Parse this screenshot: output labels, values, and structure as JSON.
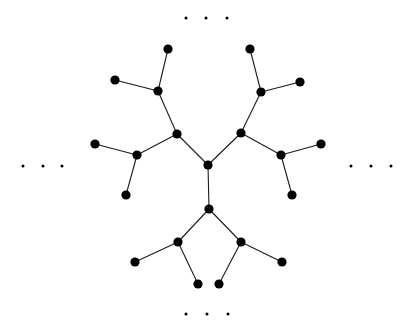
{
  "figure": {
    "width": 408,
    "height": 329,
    "background_color": "#ffffff",
    "node_color": "#000000",
    "edge_color": "#1a1a1a",
    "node_radius": 4.6,
    "ellipsis_dot_radius": 1.5,
    "edge_width": 1.1
  },
  "graph": {
    "type": "tree",
    "description": "Bethe lattice / Cayley tree with degree-3 root and continuing branches indicated by ellipses",
    "nodes": [
      {
        "id": "root",
        "label": "root",
        "x": 208,
        "y": 165
      },
      {
        "id": "u-left",
        "label": "u-left",
        "x": 177,
        "y": 134
      },
      {
        "id": "u-right",
        "label": "u-right",
        "x": 241,
        "y": 133
      },
      {
        "id": "d-center",
        "label": "d-center",
        "x": 209,
        "y": 209
      },
      {
        "id": "ul-up",
        "label": "ul-up",
        "x": 158,
        "y": 91
      },
      {
        "id": "ul-left",
        "label": "ul-left",
        "x": 137,
        "y": 155
      },
      {
        "id": "ul-up-a",
        "label": "ul-up-a",
        "x": 168,
        "y": 49
      },
      {
        "id": "ul-up-b",
        "label": "ul-up-b",
        "x": 115,
        "y": 80
      },
      {
        "id": "ul-left-a",
        "label": "ul-left-a",
        "x": 95,
        "y": 144
      },
      {
        "id": "ul-left-b",
        "label": "ul-left-b",
        "x": 126,
        "y": 195
      },
      {
        "id": "ur-up",
        "label": "ur-up",
        "x": 261,
        "y": 92
      },
      {
        "id": "ur-right",
        "label": "ur-right",
        "x": 281,
        "y": 155
      },
      {
        "id": "ur-up-a",
        "label": "ur-up-a",
        "x": 250,
        "y": 49
      },
      {
        "id": "ur-up-b",
        "label": "ur-up-b",
        "x": 300,
        "y": 82
      },
      {
        "id": "ur-right-a",
        "label": "ur-right-a",
        "x": 321,
        "y": 144
      },
      {
        "id": "ur-right-b",
        "label": "ur-right-b",
        "x": 292,
        "y": 195
      },
      {
        "id": "dl",
        "label": "dl",
        "x": 178,
        "y": 242
      },
      {
        "id": "dr",
        "label": "dr",
        "x": 241,
        "y": 242
      },
      {
        "id": "dl-a",
        "label": "dl-a",
        "x": 135,
        "y": 262
      },
      {
        "id": "dl-b",
        "label": "dl-b",
        "x": 198,
        "y": 284
      },
      {
        "id": "dr-a",
        "label": "dr-a",
        "x": 219,
        "y": 284
      },
      {
        "id": "dr-b",
        "label": "dr-b",
        "x": 282,
        "y": 262
      }
    ],
    "edges": [
      {
        "from": "root",
        "to": "u-left"
      },
      {
        "from": "root",
        "to": "u-right"
      },
      {
        "from": "root",
        "to": "d-center"
      },
      {
        "from": "u-left",
        "to": "ul-up"
      },
      {
        "from": "u-left",
        "to": "ul-left"
      },
      {
        "from": "ul-up",
        "to": "ul-up-a"
      },
      {
        "from": "ul-up",
        "to": "ul-up-b"
      },
      {
        "from": "ul-left",
        "to": "ul-left-a"
      },
      {
        "from": "ul-left",
        "to": "ul-left-b"
      },
      {
        "from": "u-right",
        "to": "ur-up"
      },
      {
        "from": "u-right",
        "to": "ur-right"
      },
      {
        "from": "ur-up",
        "to": "ur-up-a"
      },
      {
        "from": "ur-up",
        "to": "ur-up-b"
      },
      {
        "from": "ur-right",
        "to": "ur-right-a"
      },
      {
        "from": "ur-right",
        "to": "ur-right-b"
      },
      {
        "from": "d-center",
        "to": "dl"
      },
      {
        "from": "d-center",
        "to": "dr"
      },
      {
        "from": "dl",
        "to": "dl-a"
      },
      {
        "from": "dl",
        "to": "dl-b"
      },
      {
        "from": "dr",
        "to": "dr-a"
      },
      {
        "from": "dr",
        "to": "dr-b"
      }
    ]
  },
  "ellipses": [
    {
      "name": "ellipsis-top",
      "dots": [
        {
          "x": 186,
          "y": 18
        },
        {
          "x": 206,
          "y": 18
        },
        {
          "x": 227,
          "y": 18
        }
      ]
    },
    {
      "name": "ellipsis-left",
      "dots": [
        {
          "x": 23,
          "y": 166
        },
        {
          "x": 43,
          "y": 166
        },
        {
          "x": 62,
          "y": 166
        }
      ]
    },
    {
      "name": "ellipsis-right",
      "dots": [
        {
          "x": 351,
          "y": 166
        },
        {
          "x": 371,
          "y": 166
        },
        {
          "x": 391,
          "y": 166
        }
      ]
    },
    {
      "name": "ellipsis-bottom",
      "dots": [
        {
          "x": 186,
          "y": 314
        },
        {
          "x": 207,
          "y": 314
        },
        {
          "x": 228,
          "y": 314
        }
      ]
    }
  ]
}
